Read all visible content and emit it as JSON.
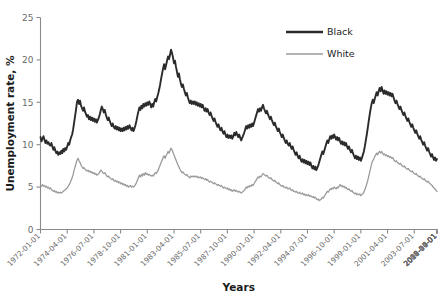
{
  "chart_data": {
    "type": "line",
    "title": "",
    "xlabel": "Years",
    "ylabel": "Unemployment rate, %",
    "ylim": [
      0,
      25
    ],
    "yticks": [
      0,
      5,
      10,
      15,
      20,
      25
    ],
    "grid": false,
    "legend_position": "top-right",
    "x_tick_labels": [
      "1972-01-01",
      "1974-04-01",
      "1976-07-01",
      "1978-10-01",
      "1981-01-01",
      "1983-04-01",
      "1985-07-01",
      "1987-10-01",
      "1990-01-01",
      "1992-04-01",
      "1994-07-01",
      "1996-10-01",
      "1999-01-01",
      "2001-04-01",
      "2003-07-01",
      "2005-10-01",
      "2008-01-01",
      "2010-04-01",
      "2012-07-01",
      "2014-10-01"
    ],
    "x_start": "1972-01-01",
    "x_end": "2015-12-01",
    "x_step_months": 1,
    "series": [
      {
        "name": "Black",
        "color": "#2b2b2b",
        "width": 1.9,
        "values": [
          10.9,
          10.4,
          10.7,
          11.0,
          10.6,
          10.2,
          10.5,
          10.1,
          10.3,
          10.0,
          9.9,
          10.2,
          9.8,
          9.4,
          9.7,
          9.3,
          9.0,
          9.2,
          8.8,
          9.1,
          8.9,
          9.3,
          9.0,
          9.5,
          9.2,
          9.6,
          9.4,
          9.8,
          10.2,
          10.0,
          10.5,
          10.9,
          11.2,
          11.8,
          12.6,
          13.4,
          14.2,
          15.1,
          15.3,
          14.8,
          15.2,
          14.6,
          14.3,
          14.0,
          14.4,
          13.9,
          13.6,
          13.3,
          13.5,
          13.0,
          13.3,
          12.9,
          13.2,
          12.8,
          13.1,
          12.7,
          13.0,
          12.6,
          12.9,
          13.2,
          13.6,
          14.1,
          14.5,
          14.2,
          13.8,
          14.1,
          13.6,
          13.2,
          12.9,
          13.2,
          12.8,
          12.5,
          12.2,
          12.5,
          12.1,
          11.9,
          12.2,
          11.8,
          12.1,
          11.7,
          12.0,
          11.6,
          11.9,
          11.6,
          12.0,
          11.7,
          12.1,
          11.8,
          12.2,
          11.9,
          12.3,
          12.0,
          11.7,
          12.0,
          11.6,
          11.9,
          12.3,
          12.8,
          13.4,
          13.9,
          14.4,
          14.1,
          14.6,
          14.3,
          14.8,
          14.5,
          14.9,
          14.6,
          15.0,
          14.7,
          15.1,
          14.8,
          14.4,
          14.8,
          14.5,
          15.0,
          15.4,
          15.1,
          15.6,
          16.0,
          16.5,
          17.1,
          17.8,
          18.4,
          19.0,
          19.5,
          18.9,
          19.4,
          19.9,
          20.4,
          20.1,
          20.6,
          21.2,
          20.8,
          20.3,
          19.6,
          19.9,
          19.2,
          18.6,
          18.0,
          18.4,
          17.7,
          17.2,
          16.8,
          17.1,
          16.6,
          16.2,
          15.8,
          16.1,
          15.6,
          15.2,
          14.9,
          15.2,
          14.8,
          15.1,
          14.8,
          15.1,
          14.7,
          15.0,
          14.6,
          14.9,
          14.5,
          14.8,
          14.4,
          14.7,
          14.3,
          14.0,
          14.3,
          13.9,
          14.2,
          13.8,
          13.5,
          13.8,
          13.4,
          13.1,
          12.8,
          13.1,
          12.7,
          12.4,
          12.1,
          12.4,
          12.0,
          11.7,
          12.0,
          11.6,
          11.3,
          11.6,
          11.2,
          10.9,
          11.2,
          10.8,
          11.1,
          10.8,
          11.1,
          10.7,
          11.0,
          11.4,
          11.1,
          11.5,
          11.2,
          10.9,
          11.2,
          10.8,
          10.5,
          10.8,
          11.1,
          11.4,
          11.8,
          12.2,
          11.9,
          12.3,
          12.0,
          12.4,
          12.1,
          12.5,
          12.2,
          12.6,
          13.0,
          13.4,
          13.8,
          14.2,
          13.9,
          14.3,
          14.0,
          14.4,
          14.7,
          14.3,
          14.0,
          13.7,
          14.0,
          13.6,
          13.3,
          13.0,
          13.3,
          12.9,
          12.6,
          12.3,
          12.6,
          12.2,
          11.9,
          11.6,
          11.9,
          11.5,
          11.2,
          10.9,
          11.2,
          10.8,
          10.5,
          10.2,
          10.5,
          10.1,
          9.9,
          10.2,
          9.8,
          9.5,
          9.8,
          9.4,
          9.1,
          8.8,
          9.1,
          8.7,
          8.4,
          8.7,
          8.3,
          8.0,
          8.3,
          7.9,
          8.2,
          7.8,
          8.1,
          7.7,
          8.0,
          7.6,
          7.9,
          7.5,
          7.2,
          7.5,
          7.1,
          7.4,
          7.0,
          7.3,
          7.6,
          8.0,
          8.4,
          8.8,
          9.2,
          8.9,
          9.3,
          9.7,
          10.1,
          10.5,
          10.2,
          10.6,
          11.0,
          10.7,
          11.1,
          10.8,
          11.2,
          10.9,
          10.6,
          10.9,
          10.5,
          10.8,
          10.4,
          10.1,
          10.4,
          10.0,
          10.3,
          9.9,
          10.2,
          9.8,
          9.5,
          9.8,
          9.4,
          9.1,
          9.4,
          9.0,
          8.7,
          8.4,
          8.7,
          8.3,
          8.6,
          8.2,
          8.5,
          8.1,
          8.4,
          8.8,
          9.2,
          9.8,
          10.5,
          11.2,
          12.0,
          12.8,
          13.6,
          14.3,
          14.9,
          15.3,
          14.9,
          15.4,
          15.8,
          16.2,
          15.8,
          16.3,
          16.7,
          16.3,
          16.8,
          16.4,
          16.0,
          16.4,
          16.0,
          16.3,
          15.9,
          16.2,
          15.8,
          16.1,
          15.7,
          16.0,
          15.6,
          15.2,
          14.9,
          15.2,
          14.8,
          14.5,
          14.2,
          14.5,
          14.1,
          13.8,
          13.5,
          13.8,
          13.4,
          13.1,
          12.8,
          13.1,
          12.7,
          12.4,
          12.1,
          12.4,
          12.0,
          11.7,
          11.4,
          11.7,
          11.3,
          11.0,
          10.7,
          11.0,
          10.6,
          10.3,
          10.0,
          10.3,
          9.9,
          9.6,
          9.3,
          9.6,
          9.2,
          8.9,
          8.6,
          8.9,
          8.5,
          8.2,
          8.5,
          8.1,
          8.3
        ]
      },
      {
        "name": "White",
        "color": "#9b9b9b",
        "width": 1.3,
        "values": [
          5.2,
          5.1,
          5.3,
          5.1,
          5.2,
          5.0,
          5.1,
          4.9,
          5.0,
          4.8,
          4.9,
          4.7,
          4.6,
          4.5,
          4.6,
          4.4,
          4.5,
          4.3,
          4.4,
          4.3,
          4.4,
          4.3,
          4.4,
          4.5,
          4.6,
          4.7,
          4.8,
          4.9,
          5.1,
          5.3,
          5.5,
          5.8,
          6.1,
          6.5,
          7.0,
          7.4,
          7.8,
          8.2,
          8.4,
          8.1,
          7.9,
          7.6,
          7.4,
          7.2,
          7.3,
          7.1,
          7.0,
          6.9,
          7.0,
          6.8,
          6.9,
          6.7,
          6.8,
          6.6,
          6.7,
          6.5,
          6.6,
          6.4,
          6.5,
          6.6,
          6.8,
          7.0,
          6.9,
          6.7,
          6.6,
          6.7,
          6.5,
          6.3,
          6.2,
          6.3,
          6.1,
          6.0,
          5.9,
          6.0,
          5.8,
          5.7,
          5.8,
          5.6,
          5.7,
          5.5,
          5.6,
          5.4,
          5.5,
          5.3,
          5.4,
          5.2,
          5.3,
          5.1,
          5.2,
          5.0,
          5.1,
          5.2,
          5.0,
          5.1,
          5.0,
          5.1,
          5.3,
          5.5,
          5.8,
          6.1,
          6.4,
          6.2,
          6.5,
          6.3,
          6.6,
          6.4,
          6.7,
          6.5,
          6.6,
          6.4,
          6.5,
          6.4,
          6.3,
          6.4,
          6.3,
          6.5,
          6.7,
          6.6,
          6.8,
          7.0,
          7.3,
          7.6,
          7.9,
          8.2,
          8.5,
          8.7,
          8.4,
          8.7,
          8.9,
          9.2,
          9.0,
          9.3,
          9.6,
          9.4,
          9.1,
          8.8,
          8.5,
          8.2,
          7.9,
          7.6,
          7.4,
          7.1,
          6.9,
          6.7,
          6.8,
          6.6,
          6.5,
          6.4,
          6.5,
          6.3,
          6.2,
          6.1,
          6.3,
          6.2,
          6.3,
          6.2,
          6.3,
          6.2,
          6.3,
          6.1,
          6.2,
          6.1,
          6.2,
          6.0,
          6.1,
          6.0,
          5.9,
          6.0,
          5.8,
          5.9,
          5.7,
          5.6,
          5.7,
          5.6,
          5.5,
          5.4,
          5.5,
          5.4,
          5.3,
          5.2,
          5.3,
          5.2,
          5.1,
          5.2,
          5.0,
          4.9,
          5.0,
          4.9,
          4.8,
          4.9,
          4.7,
          4.8,
          4.6,
          4.7,
          4.5,
          4.6,
          4.7,
          4.5,
          4.6,
          4.5,
          4.4,
          4.5,
          4.4,
          4.3,
          4.4,
          4.5,
          4.6,
          4.8,
          5.0,
          4.9,
          5.1,
          5.0,
          5.2,
          5.1,
          5.3,
          5.2,
          5.4,
          5.6,
          5.8,
          6.0,
          6.2,
          6.1,
          6.3,
          6.2,
          6.4,
          6.6,
          6.5,
          6.4,
          6.3,
          6.4,
          6.2,
          6.1,
          6.0,
          6.1,
          5.9,
          5.8,
          5.7,
          5.8,
          5.6,
          5.5,
          5.4,
          5.5,
          5.3,
          5.2,
          5.1,
          5.2,
          5.0,
          5.0,
          4.9,
          5.0,
          4.8,
          4.8,
          4.9,
          4.7,
          4.6,
          4.7,
          4.5,
          4.5,
          4.4,
          4.5,
          4.3,
          4.3,
          4.4,
          4.2,
          4.2,
          4.3,
          4.1,
          4.2,
          4.0,
          4.1,
          4.0,
          4.1,
          3.9,
          4.0,
          3.9,
          3.8,
          3.9,
          3.7,
          3.8,
          3.6,
          3.5,
          3.6,
          3.4,
          3.5,
          3.6,
          3.8,
          3.7,
          3.9,
          4.1,
          4.3,
          4.5,
          4.4,
          4.6,
          4.8,
          4.7,
          4.9,
          4.8,
          5.0,
          4.9,
          4.8,
          5.0,
          4.9,
          5.1,
          5.3,
          5.1,
          5.2,
          5.0,
          5.1,
          4.9,
          5.0,
          4.8,
          4.7,
          4.8,
          4.6,
          4.5,
          4.6,
          4.4,
          4.3,
          4.2,
          4.3,
          4.1,
          4.2,
          4.1,
          4.2,
          4.0,
          4.1,
          4.2,
          4.4,
          4.7,
          5.0,
          5.4,
          5.8,
          6.3,
          6.8,
          7.3,
          7.8,
          8.1,
          8.3,
          8.6,
          8.8,
          9.0,
          8.8,
          9.1,
          9.2,
          9.0,
          9.2,
          9.0,
          8.8,
          8.9,
          8.7,
          8.8,
          8.6,
          8.7,
          8.5,
          8.6,
          8.4,
          8.5,
          8.3,
          8.1,
          8.0,
          8.1,
          7.9,
          7.8,
          7.7,
          7.8,
          7.6,
          7.5,
          7.4,
          7.5,
          7.3,
          7.2,
          7.1,
          7.2,
          7.0,
          6.9,
          6.8,
          6.9,
          6.7,
          6.6,
          6.5,
          6.6,
          6.4,
          6.3,
          6.2,
          6.3,
          6.1,
          6.0,
          5.9,
          6.0,
          5.8,
          5.7,
          5.6,
          5.7,
          5.5,
          5.4,
          5.3,
          5.2,
          5.0,
          4.9,
          4.8,
          4.6,
          4.5
        ]
      }
    ]
  },
  "legend": {
    "items": [
      {
        "label": "Black",
        "color": "#2b2b2b"
      },
      {
        "label": "White",
        "color": "#9b9b9b"
      }
    ]
  }
}
